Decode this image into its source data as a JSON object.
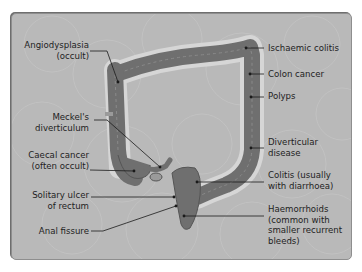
{
  "diagram": {
    "colors": {
      "panel": "#b9b9b9",
      "colon_fill": "#6f6f6f",
      "colon_outline": "#555555",
      "halo": "#d9d9d9",
      "leader_line": "#1a1a1a",
      "text": "#1e1e1e"
    },
    "labels_left": [
      {
        "id": "angiodysplasia",
        "lines": [
          "Angiodysplasia",
          "(occult)"
        ]
      },
      {
        "id": "meckels",
        "lines": [
          "Meckel's",
          "diverticulum"
        ]
      },
      {
        "id": "caecal-cancer",
        "lines": [
          "Caecal cancer",
          "(often occult)"
        ]
      },
      {
        "id": "solitary-ulcer",
        "lines": [
          "Solitary ulcer",
          "of rectum"
        ]
      },
      {
        "id": "anal-fissure",
        "lines": [
          "Anal fissure"
        ]
      }
    ],
    "labels_right": [
      {
        "id": "ischaemic-colitis",
        "lines": [
          "Ischaemic colitis"
        ]
      },
      {
        "id": "colon-cancer",
        "lines": [
          "Colon cancer"
        ]
      },
      {
        "id": "polyps",
        "lines": [
          "Polyps"
        ]
      },
      {
        "id": "diverticular-disease",
        "lines": [
          "Diverticular",
          "disease"
        ]
      },
      {
        "id": "colitis",
        "lines": [
          "Colitis (usually",
          "with diarrhoea)"
        ]
      },
      {
        "id": "haemorrhoids",
        "lines": [
          "Haemorrhoids",
          "(common with",
          "smaller recurrent",
          "bleeds)"
        ]
      }
    ]
  }
}
